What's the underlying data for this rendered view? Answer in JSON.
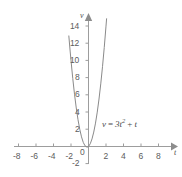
{
  "chart_data": {
    "type": "line",
    "title": "",
    "subtitle": "",
    "xlabel": "t",
    "ylabel": "v",
    "equation": "v = 3t² + t",
    "equation_parts": {
      "lhs": "v",
      "equals": "=",
      "coefficient": "3",
      "variable": "t",
      "exponent": "2",
      "plus": "+",
      "linear_term": "t"
    },
    "xlim": [
      -9,
      9
    ],
    "ylim": [
      -2.8,
      15.2
    ],
    "xticks": [
      -8,
      -6,
      -4,
      -2,
      0,
      2,
      4,
      6,
      8
    ],
    "xtick_labels": [
      "-8",
      "-6",
      "-4",
      "-2",
      "0",
      "2",
      "4",
      "6",
      "8"
    ],
    "yticks": [
      -2,
      2,
      4,
      6,
      8,
      10,
      12,
      14
    ],
    "ytick_labels": [
      "-2",
      "2",
      "4",
      "6",
      "8",
      "10",
      "12",
      "14"
    ],
    "origin_label": "0",
    "grid": false,
    "legend": "none",
    "axis_arrows": [
      "x-positive",
      "y-positive"
    ],
    "series": [
      {
        "name": "v = 3t² + t",
        "color": "#8a8a8a",
        "points": [
          {
            "t": -2.25,
            "v": 12.9
          },
          {
            "t": -2.1,
            "v": 11.1
          },
          {
            "t": -2.0,
            "v": 10.0
          },
          {
            "t": -1.8,
            "v": 7.92
          },
          {
            "t": -1.6,
            "v": 6.08
          },
          {
            "t": -1.4,
            "v": 4.48
          },
          {
            "t": -1.2,
            "v": 3.12
          },
          {
            "t": -1.0,
            "v": 2.0
          },
          {
            "t": -0.8,
            "v": 1.12
          },
          {
            "t": -0.6,
            "v": 0.48
          },
          {
            "t": -0.4,
            "v": 0.08
          },
          {
            "t": -0.1667,
            "v": -0.0833
          },
          {
            "t": 0.0,
            "v": 0.0
          },
          {
            "t": 0.2,
            "v": 0.32
          },
          {
            "t": 0.4,
            "v": 0.88
          },
          {
            "t": 0.6,
            "v": 1.68
          },
          {
            "t": 0.8,
            "v": 2.72
          },
          {
            "t": 1.0,
            "v": 4.0
          },
          {
            "t": 1.2,
            "v": 5.52
          },
          {
            "t": 1.4,
            "v": 7.28
          },
          {
            "t": 1.6,
            "v": 9.28
          },
          {
            "t": 1.8,
            "v": 11.52
          },
          {
            "t": 2.0,
            "v": 14.0
          },
          {
            "t": 2.07,
            "v": 14.9
          }
        ]
      }
    ],
    "vertex": {
      "t": -0.1667,
      "v": -0.0833
    },
    "colors": {
      "axis": "#9d9d9d",
      "curve": "#8a8a8a",
      "text": "#5c5c5c",
      "background": "#ffffff"
    }
  }
}
